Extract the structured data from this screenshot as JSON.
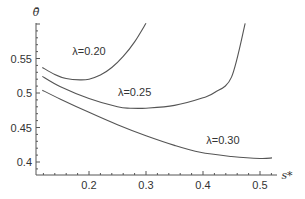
{
  "chart_data": {
    "type": "line",
    "title": "",
    "xlabel": "s*",
    "ylabel": "θ̄",
    "xlim": [
      0.115,
      0.535
    ],
    "ylim": [
      0.382,
      0.6
    ],
    "xticks": [
      0.2,
      0.3,
      0.4,
      0.5
    ],
    "xtick_labels": [
      "0.2",
      "0.3",
      "0.4",
      "0.5"
    ],
    "yticks": [
      0.4,
      0.45,
      0.5,
      0.55
    ],
    "ytick_labels": [
      "0.4",
      "0.45",
      "0.5",
      "0.55"
    ],
    "grid": false,
    "legend": "inline labels",
    "series": [
      {
        "name": "λ=0.20",
        "label_pos": [
          0.2,
          0.555
        ],
        "x": [
          0.118,
          0.14,
          0.16,
          0.184,
          0.2,
          0.22,
          0.24,
          0.26,
          0.28,
          0.3
        ],
        "y": [
          0.537,
          0.527,
          0.521,
          0.519,
          0.52,
          0.526,
          0.537,
          0.553,
          0.574,
          0.601
        ]
      },
      {
        "name": "λ=0.25",
        "label_pos": [
          0.28,
          0.496
        ],
        "x": [
          0.118,
          0.15,
          0.2,
          0.25,
          0.272,
          0.3,
          0.35,
          0.4,
          0.421,
          0.45,
          0.474
        ],
        "y": [
          0.524,
          0.509,
          0.492,
          0.48,
          0.478,
          0.478,
          0.482,
          0.493,
          0.501,
          0.523,
          0.601
        ]
      },
      {
        "name": "λ=0.30",
        "label_pos": [
          0.435,
          0.426
        ],
        "x": [
          0.118,
          0.15,
          0.2,
          0.25,
          0.3,
          0.35,
          0.395,
          0.45,
          0.5,
          0.521
        ],
        "y": [
          0.504,
          0.491,
          0.472,
          0.454,
          0.438,
          0.424,
          0.414,
          0.408,
          0.405,
          0.406
        ]
      }
    ]
  }
}
